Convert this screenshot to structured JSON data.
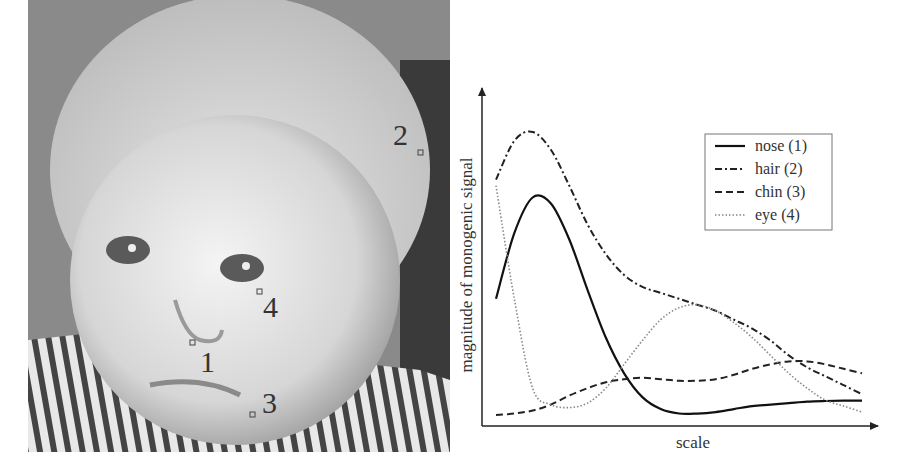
{
  "photo": {
    "description": "grayscale photo of a baby's face with four annotated points",
    "markers": [
      {
        "id": "1",
        "label": "1",
        "x": 193,
        "y": 343,
        "lx": 200,
        "ly": 372
      },
      {
        "id": "2",
        "label": "2",
        "x": 420,
        "y": 152,
        "lx": 393,
        "ly": 145
      },
      {
        "id": "3",
        "label": "3",
        "x": 252,
        "y": 415,
        "lx": 262,
        "ly": 413
      },
      {
        "id": "4",
        "label": "4",
        "x": 259,
        "y": 292,
        "lx": 263,
        "ly": 317
      }
    ]
  },
  "chart_data": {
    "type": "line",
    "title": "",
    "xlabel": "scale",
    "ylabel": "magnitude of monogenic signal",
    "grid": false,
    "legend_position": "upper right",
    "x": [
      0,
      0.05,
      0.1,
      0.15,
      0.2,
      0.25,
      0.3,
      0.35,
      0.4,
      0.45,
      0.5,
      0.55,
      0.6,
      0.65,
      0.7,
      0.75,
      0.8,
      0.85,
      0.9,
      0.95,
      1.0
    ],
    "series": [
      {
        "name": "nose (1)",
        "style": "solid",
        "values": [
          0.4,
          0.62,
          0.74,
          0.72,
          0.6,
          0.43,
          0.27,
          0.15,
          0.07,
          0.03,
          0.015,
          0.015,
          0.02,
          0.03,
          0.04,
          0.045,
          0.05,
          0.055,
          0.057,
          0.058,
          0.058
        ]
      },
      {
        "name": "hair (2)",
        "style": "dashdot",
        "values": [
          0.8,
          0.93,
          0.96,
          0.9,
          0.78,
          0.65,
          0.55,
          0.48,
          0.44,
          0.42,
          0.4,
          0.38,
          0.36,
          0.33,
          0.3,
          0.26,
          0.21,
          0.17,
          0.14,
          0.11,
          0.08
        ]
      },
      {
        "name": "chin (3)",
        "style": "dashed",
        "values": [
          0.01,
          0.015,
          0.025,
          0.045,
          0.075,
          0.1,
          0.12,
          0.13,
          0.135,
          0.13,
          0.125,
          0.125,
          0.13,
          0.145,
          0.165,
          0.18,
          0.19,
          0.19,
          0.18,
          0.165,
          0.15
        ]
      },
      {
        "name": "eye (4)",
        "style": "dotted",
        "values": [
          0.78,
          0.4,
          0.1,
          0.045,
          0.035,
          0.05,
          0.1,
          0.18,
          0.26,
          0.33,
          0.37,
          0.38,
          0.36,
          0.32,
          0.27,
          0.21,
          0.15,
          0.1,
          0.06,
          0.04,
          0.02
        ]
      }
    ]
  }
}
